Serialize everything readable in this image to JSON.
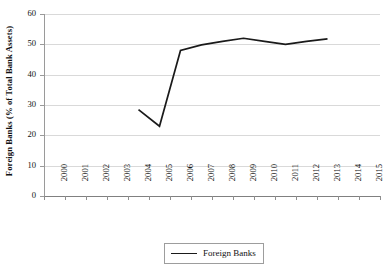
{
  "chart_data": {
    "type": "line",
    "title": "",
    "xlabel": "",
    "ylabel": "Foreign Banks (% of Total Bank Assets)",
    "categories": [
      "2000",
      "2001",
      "2002",
      "2003",
      "2004",
      "2005",
      "2006",
      "2007",
      "2008",
      "2009",
      "2010",
      "2011",
      "2012",
      "2013",
      "2014",
      "2015"
    ],
    "xticklabels": [
      "2000",
      "2001",
      "2002",
      "2003",
      "2004",
      "2005",
      "2006",
      "2007",
      "2008",
      "2009",
      "2010",
      "2011",
      "2012",
      "2013",
      "2014",
      "2015"
    ],
    "yticklabels": [
      "0",
      "10",
      "20",
      "30",
      "40",
      "50",
      "60"
    ],
    "ytickvalues": [
      0,
      10,
      20,
      30,
      40,
      50,
      60
    ],
    "ylim": [
      0,
      60
    ],
    "grid": "horizontal",
    "legend_position": "bottom-center",
    "series": [
      {
        "name": "Foreign Banks",
        "color": "#1a1a1a",
        "x": [
          "2004",
          "2005",
          "2006",
          "2007",
          "2008",
          "2009",
          "2010",
          "2011",
          "2012",
          "2013"
        ],
        "values": [
          28.5,
          23.0,
          48.0,
          49.8,
          51.0,
          52.0,
          51.0,
          50.0,
          51.0,
          51.8
        ]
      }
    ]
  },
  "legend": {
    "entries": [
      {
        "label": "Foreign Banks",
        "color": "#1a1a1a"
      }
    ]
  },
  "axes": {
    "y_title": "Foreign Banks (% of Total Bank Assets)"
  }
}
